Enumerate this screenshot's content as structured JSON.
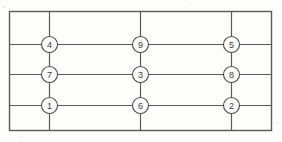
{
  "diagram": {
    "type": "node-grid",
    "background_color": "#fdfdfc",
    "line_color": "#5a5a5a",
    "node_fill_color": "#ffffff",
    "node_stroke_color": "#4a4a4a",
    "label_color": "#3b3b3b",
    "frame": {
      "x": 9,
      "y": 11,
      "width": 263,
      "height": 120
    },
    "columns_x": [
      49,
      140,
      231
    ],
    "rows_y": [
      44,
      74,
      105
    ],
    "node_radius": 8,
    "nodes": [
      {
        "id": "node-4",
        "label": "4",
        "row": 0,
        "col": 0,
        "cx": 49,
        "cy": 44
      },
      {
        "id": "node-9",
        "label": "9",
        "row": 0,
        "col": 1,
        "cx": 140,
        "cy": 44
      },
      {
        "id": "node-5",
        "label": "5",
        "row": 0,
        "col": 2,
        "cx": 231,
        "cy": 44
      },
      {
        "id": "node-7",
        "label": "7",
        "row": 1,
        "col": 0,
        "cx": 49,
        "cy": 74
      },
      {
        "id": "node-3",
        "label": "3",
        "row": 1,
        "col": 1,
        "cx": 140,
        "cy": 74
      },
      {
        "id": "node-8",
        "label": "8",
        "row": 1,
        "col": 2,
        "cx": 231,
        "cy": 74
      },
      {
        "id": "node-1",
        "label": "1",
        "row": 2,
        "col": 0,
        "cx": 49,
        "cy": 105
      },
      {
        "id": "node-6",
        "label": "6",
        "row": 2,
        "col": 1,
        "cx": 140,
        "cy": 105
      },
      {
        "id": "node-2",
        "label": "2",
        "row": 2,
        "col": 2,
        "cx": 231,
        "cy": 105
      }
    ],
    "rows": [
      {
        "name": "top-row",
        "labels": [
          "4",
          "9",
          "5"
        ]
      },
      {
        "name": "middle-row",
        "labels": [
          "7",
          "3",
          "8"
        ]
      },
      {
        "name": "bottom-row",
        "labels": [
          "1",
          "6",
          "2"
        ]
      }
    ]
  }
}
